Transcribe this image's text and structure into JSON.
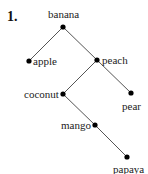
{
  "problem_number": "1.",
  "tree": {
    "nodes": [
      {
        "id": "banana",
        "label": "banana",
        "x": 63,
        "y": 27,
        "lx": 48,
        "ly": 9
      },
      {
        "id": "apple",
        "label": "apple",
        "x": 29,
        "y": 61,
        "lx": 33,
        "ly": 56
      },
      {
        "id": "peach",
        "label": "peach",
        "x": 97,
        "y": 60,
        "lx": 102,
        "ly": 55
      },
      {
        "id": "coconut",
        "label": "coconut",
        "x": 63,
        "y": 94,
        "lx": 24,
        "ly": 89
      },
      {
        "id": "pear",
        "label": "pear",
        "x": 131,
        "y": 93,
        "lx": 122,
        "ly": 101
      },
      {
        "id": "mango",
        "label": "mango",
        "x": 95,
        "y": 125,
        "lx": 61,
        "ly": 120
      },
      {
        "id": "papaya",
        "label": "papaya",
        "x": 127,
        "y": 157,
        "lx": 113,
        "ly": 164
      }
    ],
    "edges": [
      [
        "banana",
        "apple"
      ],
      [
        "banana",
        "peach"
      ],
      [
        "peach",
        "coconut"
      ],
      [
        "peach",
        "pear"
      ],
      [
        "coconut",
        "mango"
      ],
      [
        "mango",
        "papaya"
      ]
    ],
    "line_color": "#555555",
    "dot_color": "#000000"
  }
}
